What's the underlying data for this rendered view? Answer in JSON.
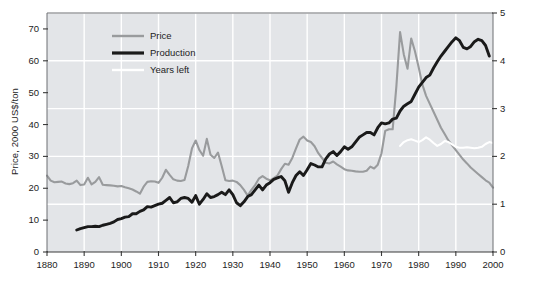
{
  "chart_data": {
    "type": "line",
    "title": "",
    "xlabel": "",
    "ylabel": "Price, 2000 US$/ton",
    "ylabel_right": "Production, billion tons; hundred years",
    "xlim": [
      1880,
      2000
    ],
    "ylim": [
      0,
      75
    ],
    "ylim_right": [
      0,
      5
    ],
    "xticks": [
      1880,
      1890,
      1900,
      1910,
      1920,
      1930,
      1940,
      1950,
      1960,
      1970,
      1980,
      1990,
      2000
    ],
    "yticks_left": [
      0,
      10,
      20,
      30,
      40,
      50,
      60,
      70
    ],
    "yticks_right": [
      0,
      1,
      2,
      3,
      4,
      5
    ],
    "grid": true,
    "legend_position": "top-left-inside",
    "plot_background": "#e3e5e8",
    "grid_color": "#ffffff",
    "series": [
      {
        "name": "Price",
        "axis": "left",
        "color": "#999b9d",
        "x": [
          1880,
          1881,
          1882,
          1883,
          1884,
          1885,
          1886,
          1887,
          1888,
          1889,
          1890,
          1891,
          1892,
          1893,
          1894,
          1895,
          1896,
          1897,
          1898,
          1899,
          1900,
          1901,
          1902,
          1903,
          1904,
          1905,
          1906,
          1907,
          1908,
          1909,
          1910,
          1911,
          1912,
          1913,
          1914,
          1915,
          1916,
          1917,
          1918,
          1919,
          1920,
          1921,
          1922,
          1923,
          1924,
          1925,
          1926,
          1927,
          1928,
          1929,
          1930,
          1931,
          1932,
          1933,
          1934,
          1935,
          1936,
          1937,
          1938,
          1939,
          1940,
          1941,
          1942,
          1943,
          1944,
          1945,
          1946,
          1947,
          1948,
          1949,
          1950,
          1951,
          1952,
          1953,
          1954,
          1955,
          1956,
          1957,
          1958,
          1959,
          1960,
          1961,
          1962,
          1963,
          1964,
          1965,
          1966,
          1967,
          1968,
          1969,
          1970,
          1971,
          1972,
          1973,
          1974,
          1975,
          1976,
          1977,
          1978,
          1979,
          1980,
          1981,
          1982,
          1983,
          1984,
          1985,
          1986,
          1987,
          1988,
          1989,
          1990,
          1991,
          1992,
          1993,
          1994,
          1995,
          1996,
          1997,
          1998,
          1999,
          2000
        ],
        "y": [
          24.0,
          22.4,
          21.9,
          22.0,
          22.1,
          21.5,
          21.3,
          21.6,
          22.4,
          21.0,
          21.2,
          23.3,
          21.2,
          22.0,
          23.5,
          21.1,
          21.0,
          20.9,
          20.8,
          20.6,
          20.7,
          20.3,
          20.0,
          19.6,
          19.0,
          18.3,
          20.5,
          22.0,
          22.2,
          22.1,
          21.7,
          23.3,
          25.8,
          24.2,
          22.8,
          22.4,
          22.3,
          22.6,
          27.0,
          32.5,
          35.0,
          32.0,
          30.2,
          35.5,
          30.5,
          29.5,
          31.2,
          27.0,
          22.5,
          22.3,
          22.4,
          22.0,
          21.0,
          19.5,
          17.7,
          19.5,
          21.0,
          23.0,
          23.8,
          23.0,
          22.5,
          23.2,
          24.0,
          26.0,
          27.7,
          27.4,
          29.5,
          32.5,
          35.3,
          36.2,
          35.0,
          34.5,
          33.2,
          31.0,
          29.5,
          28.0,
          27.8,
          28.4,
          27.5,
          26.8,
          26.0,
          25.6,
          25.5,
          25.3,
          25.2,
          25.2,
          25.5,
          26.8,
          26.2,
          27.4,
          31.0,
          38.0,
          38.5,
          38.5,
          52.0,
          69.0,
          62.0,
          57.5,
          67.0,
          63.0,
          58.0,
          52.5,
          49.0,
          46.5,
          44.0,
          41.5,
          39.0,
          37.0,
          35.0,
          33.5,
          32.0,
          30.5,
          29.0,
          27.8,
          26.5,
          25.5,
          24.5,
          23.5,
          22.5,
          21.8,
          20.2
        ]
      },
      {
        "name": "Production",
        "axis": "right",
        "color": "#1a1a1a",
        "x": [
          1888,
          1889,
          1890,
          1891,
          1892,
          1893,
          1894,
          1895,
          1896,
          1897,
          1898,
          1899,
          1900,
          1901,
          1902,
          1903,
          1904,
          1905,
          1906,
          1907,
          1908,
          1909,
          1910,
          1911,
          1912,
          1913,
          1914,
          1915,
          1916,
          1917,
          1918,
          1919,
          1920,
          1921,
          1922,
          1923,
          1924,
          1925,
          1926,
          1927,
          1928,
          1929,
          1930,
          1931,
          1932,
          1933,
          1934,
          1935,
          1936,
          1937,
          1938,
          1939,
          1940,
          1941,
          1942,
          1943,
          1944,
          1945,
          1946,
          1947,
          1948,
          1949,
          1950,
          1951,
          1952,
          1953,
          1954,
          1955,
          1956,
          1957,
          1958,
          1959,
          1960,
          1961,
          1962,
          1963,
          1964,
          1965,
          1966,
          1967,
          1968,
          1969,
          1970,
          1971,
          1972,
          1973,
          1974,
          1975,
          1976,
          1977,
          1978,
          1979,
          1980,
          1981,
          1982,
          1983,
          1984,
          1985,
          1986,
          1987,
          1988,
          1989,
          1990,
          1991,
          1992,
          1993,
          1994,
          1995,
          1996,
          1997,
          1998,
          1999
        ],
        "y": [
          0.46,
          0.49,
          0.51,
          0.53,
          0.53,
          0.54,
          0.53,
          0.56,
          0.58,
          0.6,
          0.63,
          0.68,
          0.7,
          0.73,
          0.74,
          0.8,
          0.8,
          0.85,
          0.88,
          0.95,
          0.94,
          0.97,
          1.0,
          1.02,
          1.08,
          1.14,
          1.03,
          1.05,
          1.12,
          1.14,
          1.12,
          1.04,
          1.18,
          1.0,
          1.1,
          1.22,
          1.14,
          1.16,
          1.2,
          1.25,
          1.2,
          1.3,
          1.2,
          1.03,
          0.97,
          1.05,
          1.16,
          1.2,
          1.3,
          1.4,
          1.3,
          1.4,
          1.45,
          1.52,
          1.55,
          1.58,
          1.49,
          1.25,
          1.45,
          1.6,
          1.68,
          1.6,
          1.72,
          1.85,
          1.82,
          1.78,
          1.78,
          1.95,
          2.05,
          2.1,
          2.02,
          2.1,
          2.2,
          2.15,
          2.2,
          2.3,
          2.4,
          2.45,
          2.5,
          2.5,
          2.45,
          2.6,
          2.7,
          2.68,
          2.7,
          2.78,
          2.8,
          2.95,
          3.05,
          3.1,
          3.15,
          3.3,
          3.45,
          3.55,
          3.65,
          3.7,
          3.85,
          3.98,
          4.1,
          4.2,
          4.3,
          4.4,
          4.48,
          4.42,
          4.28,
          4.25,
          4.3,
          4.4,
          4.45,
          4.42,
          4.32,
          4.1
        ]
      },
      {
        "name": "Years left",
        "axis": "right",
        "color": "#ffffff",
        "x": [
          1975,
          1976,
          1977,
          1978,
          1979,
          1980,
          1981,
          1982,
          1983,
          1984,
          1985,
          1986,
          1987,
          1988,
          1989,
          1990,
          1991,
          1992,
          1993,
          1994,
          1995,
          1996,
          1997,
          1998,
          1999,
          2000
        ],
        "y": [
          2.22,
          2.3,
          2.34,
          2.36,
          2.33,
          2.3,
          2.34,
          2.4,
          2.35,
          2.28,
          2.22,
          2.26,
          2.32,
          2.3,
          2.25,
          2.2,
          2.18,
          2.18,
          2.19,
          2.18,
          2.17,
          2.18,
          2.2,
          2.26,
          2.3,
          2.28
        ]
      }
    ],
    "legend": [
      {
        "label": "Price",
        "color": "#999b9d",
        "thickness": 2.4
      },
      {
        "label": "Production",
        "color": "#1a1a1a",
        "thickness": 3.2
      },
      {
        "label": "Years left",
        "color": "#ffffff",
        "thickness": 2.4
      }
    ]
  }
}
